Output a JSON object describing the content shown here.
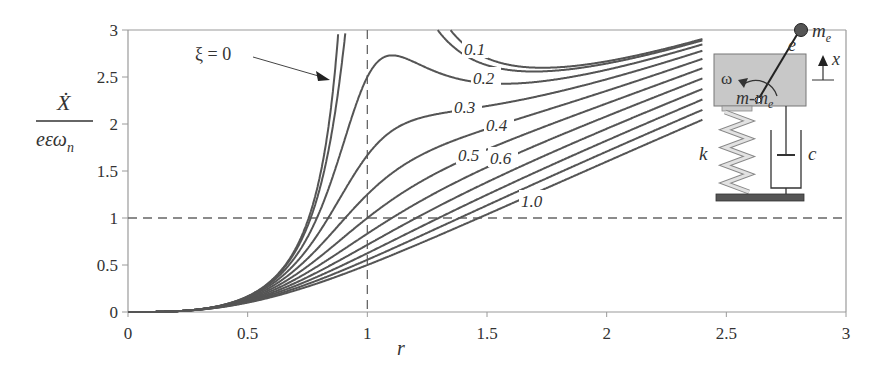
{
  "chart_data": {
    "type": "line",
    "title": "",
    "xlabel": "r",
    "ylabel": "Ẋ / (eεω_n)",
    "ylabel_parts": {
      "numerator": "Ẋ",
      "denominator": "eεω",
      "subscript": "n"
    },
    "xlim": [
      0,
      3
    ],
    "ylim": [
      0,
      3
    ],
    "x_ticks": [
      "0",
      "0.5",
      "1",
      "1.5",
      "2",
      "2.5",
      "3"
    ],
    "y_ticks": [
      "0",
      "0.5",
      "1",
      "1.5",
      "2",
      "2.5",
      "3"
    ],
    "x_tick_values": [
      0,
      0.5,
      1,
      1.5,
      2,
      2.5,
      3
    ],
    "y_tick_values": [
      0,
      0.5,
      1,
      1.5,
      2,
      2.5,
      3
    ],
    "reference_lines": [
      {
        "orientation": "vertical",
        "value": 1,
        "style": "dashed"
      },
      {
        "orientation": "horizontal",
        "value": 1,
        "style": "dashed"
      }
    ],
    "formula": "r^3 / sqrt((1 - r^2)^2 + (2*xi*r)^2)",
    "x_range_plotted": [
      0,
      2.4
    ],
    "series": [
      {
        "name": "ξ = 0",
        "xi": 0
      },
      {
        "name": "0.1",
        "xi": 0.1
      },
      {
        "name": "0.2",
        "xi": 0.2
      },
      {
        "name": "0.3",
        "xi": 0.3
      },
      {
        "name": "0.4",
        "xi": 0.4
      },
      {
        "name": "0.5",
        "xi": 0.5
      },
      {
        "name": "0.6",
        "xi": 0.6
      },
      {
        "name": "0.7",
        "xi": 0.7
      },
      {
        "name": "0.8",
        "xi": 0.8
      },
      {
        "name": "0.9",
        "xi": 0.9
      },
      {
        "name": "1.0",
        "xi": 1.0
      }
    ],
    "sample_values": {
      "r": [
        0,
        0.5,
        1.0,
        1.5,
        2.0,
        2.4
      ],
      "xi_0": [
        0,
        0.167,
        null,
        2.7,
        2.667,
        2.906
      ],
      "xi_0.2": [
        0,
        0.158,
        2.5,
        2.55,
        2.58,
        2.8
      ],
      "xi_0.5": [
        0,
        0.125,
        1.0,
        1.65,
        2.07,
        2.37
      ],
      "xi_1.0": [
        0,
        0.1,
        0.5,
        1.04,
        1.6,
        2.04
      ]
    },
    "annotations": [
      {
        "text": "ξ = 0",
        "points_to": "xi=0 curve"
      },
      {
        "text": "0.1"
      },
      {
        "text": "0.2"
      },
      {
        "text": "0.3"
      },
      {
        "text": "0.4"
      },
      {
        "text": "0.5"
      },
      {
        "text": "0.6"
      },
      {
        "text": "1.0"
      }
    ],
    "grid": false,
    "legend": "inline labels"
  },
  "diagram": {
    "mass_label": "m-m",
    "mass_label_sub": "e",
    "eccentric_mass_label": "m",
    "eccentric_mass_sub": "e",
    "eccentricity_label": "e",
    "omega_label": "ω",
    "displacement_label": "x",
    "spring_label": "k",
    "damper_label": "c",
    "colors": {
      "box": "#c8c8c8",
      "ball": "#555555",
      "ground": "#555555",
      "spring": "#d0d0d0",
      "line": "#333333"
    }
  },
  "colors": {
    "curve": "#555555",
    "axis": "#999999",
    "dashed": "#666666"
  }
}
